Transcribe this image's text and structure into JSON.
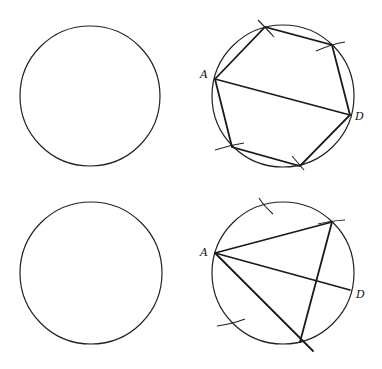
{
  "figure": {
    "panels": [
      {
        "id": "top-left",
        "type": "blank-circle",
        "circle": {
          "cx": 90,
          "cy": 96,
          "r": 70
        }
      },
      {
        "id": "top-right",
        "type": "hexagon-construction",
        "circle": {
          "cx": 283,
          "cy": 96,
          "r": 71
        },
        "labels": [
          {
            "text": "A",
            "x": 200,
            "y": 78
          },
          {
            "text": "D",
            "x": 355,
            "y": 120
          }
        ],
        "vertices": [
          [
            215,
            79
          ],
          [
            265,
            27
          ],
          [
            332,
            45
          ],
          [
            350,
            115
          ],
          [
            300,
            166
          ],
          [
            232,
            147
          ]
        ]
      },
      {
        "id": "bottom-left",
        "type": "blank-circle",
        "circle": {
          "cx": 91,
          "cy": 273,
          "r": 71
        }
      },
      {
        "id": "bottom-right",
        "type": "triangle-construction",
        "circle": {
          "cx": 283,
          "cy": 273,
          "r": 71
        },
        "labels": [
          {
            "text": "A",
            "x": 200,
            "y": 256
          },
          {
            "text": "D",
            "x": 356,
            "y": 298
          }
        ],
        "vertices": [
          [
            215,
            253
          ],
          [
            332,
            222
          ],
          [
            300,
            342
          ]
        ],
        "point_d": [
          350,
          290
        ]
      }
    ],
    "labels": {
      "point_a": "A",
      "point_d": "D"
    }
  }
}
